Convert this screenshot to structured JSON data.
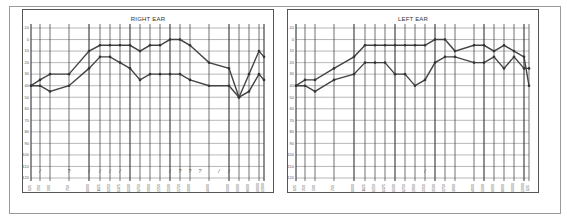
{
  "chart_data": [
    {
      "type": "line",
      "title": "RIGHT EAR",
      "xlabel": "Frequency (Hz)",
      "ylabel": "Hearing level (dB)",
      "ylim": [
        -10,
        120
      ],
      "y_inverted": true,
      "grid": true,
      "y_ticks": [
        -10,
        0,
        10,
        20,
        30,
        40,
        50,
        60,
        70,
        80,
        90,
        100,
        110,
        120
      ],
      "x": [
        125,
        250,
        500,
        750,
        1000,
        1125,
        1250,
        1375,
        1500,
        1750,
        2000,
        2250,
        2500,
        2750,
        3000,
        4000,
        5000,
        6000,
        8000,
        10000,
        12000
      ],
      "series": [
        {
          "name": "upper",
          "values": [
            40,
            35,
            30,
            30,
            10,
            5,
            5,
            5,
            5,
            10,
            5,
            5,
            0,
            0,
            5,
            20,
            25,
            50,
            30,
            10,
            15,
            35
          ]
        },
        {
          "name": "lower",
          "values": [
            40,
            40,
            45,
            40,
            25,
            15,
            15,
            20,
            25,
            35,
            30,
            30,
            30,
            30,
            35,
            40,
            40,
            50,
            45,
            30,
            35,
            25,
            30
          ]
        }
      ],
      "annotations": [
        "/",
        "?",
        "/",
        "/",
        "/",
        "/",
        "/",
        "?",
        "?",
        "?",
        "/",
        "/"
      ]
    },
    {
      "type": "line",
      "title": "LEFT EAR",
      "xlabel": "Frequency (Hz)",
      "ylabel": "Hearing level (dB)",
      "ylim": [
        -10,
        120
      ],
      "y_inverted": true,
      "grid": true,
      "y_ticks": [
        -10,
        0,
        10,
        20,
        30,
        40,
        50,
        60,
        70,
        80,
        90,
        100,
        110,
        120
      ],
      "x": [
        125,
        250,
        500,
        750,
        1000,
        1125,
        1250,
        1375,
        1500,
        1750,
        2000,
        2250,
        2500,
        2750,
        3000,
        4000,
        5000,
        6000,
        8000,
        10000,
        12000
      ],
      "series": [
        {
          "name": "upper",
          "values": [
            40,
            35,
            35,
            25,
            15,
            5,
            5,
            5,
            5,
            5,
            5,
            5,
            0,
            0,
            10,
            5,
            5,
            10,
            5,
            10,
            15,
            40
          ]
        },
        {
          "name": "lower",
          "values": [
            40,
            40,
            45,
            35,
            30,
            20,
            20,
            20,
            30,
            30,
            40,
            35,
            20,
            15,
            15,
            20,
            20,
            15,
            25,
            15,
            25,
            25,
            40
          ]
        }
      ],
      "annotations": [
        "/"
      ]
    }
  ],
  "panels": {
    "right_title": "RIGHT EAR",
    "left_title": "LEFT EAR"
  },
  "y_labels": [
    "-10",
    "0",
    "10",
    "20",
    "30",
    "40",
    "50",
    "60",
    "70",
    "80",
    "90",
    "100",
    "110",
    "120"
  ],
  "x_labels": [
    "125",
    "250",
    "500",
    "750",
    "1000",
    "1125",
    "1250",
    "1375",
    "1500",
    "1750",
    "2000",
    "2250",
    "2500",
    "2750",
    "3000",
    "4000",
    "5000",
    "6000",
    "8000",
    "10000",
    "12000"
  ]
}
